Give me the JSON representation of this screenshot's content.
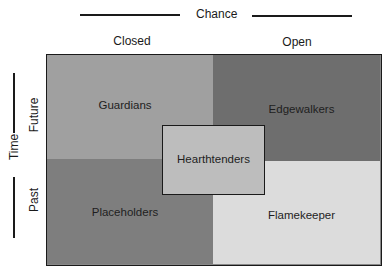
{
  "axes": {
    "horizontal": {
      "title": "Chance",
      "columns": [
        {
          "label": "Closed"
        },
        {
          "label": "Open"
        }
      ]
    },
    "vertical": {
      "title": "Time",
      "rows": [
        {
          "label": "Future"
        },
        {
          "label": "Past"
        }
      ]
    }
  },
  "quadrants": [
    {
      "id": "future-closed",
      "label": "Guardians",
      "color": "#a0a0a0"
    },
    {
      "id": "future-open",
      "label": "Edgewalkers",
      "color": "#6e6e6e"
    },
    {
      "id": "past-closed",
      "label": "Placeholders",
      "color": "#7e7e7e"
    },
    {
      "id": "past-open",
      "label": "Flamekeeper",
      "color": "#dcdcdc"
    }
  ],
  "center": {
    "label": "Hearthtenders",
    "color": "#bdbdbd"
  },
  "colors": {
    "line": "#1a1a1a",
    "text": "#1e1e1e",
    "background": "#ffffff"
  }
}
